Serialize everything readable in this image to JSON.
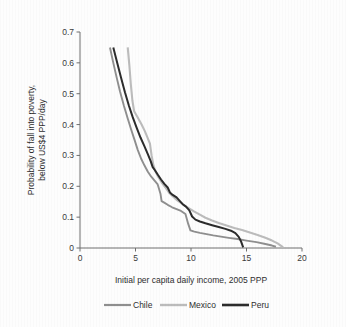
{
  "chart_data": {
    "type": "line",
    "title": "",
    "xlabel": "Initial per capita daily income, 2005 PPP",
    "ylabel": "Probability of fall into poverty, below US$4 PPP/day",
    "xlim": [
      0,
      20
    ],
    "ylim": [
      0,
      0.7
    ],
    "grid": false,
    "legend_position": "bottom",
    "xticks": [
      "0",
      "5",
      "10",
      "15",
      "20"
    ],
    "xtick_values": [
      0,
      5,
      10,
      15,
      20
    ],
    "yticks": [
      "0",
      "0.1",
      "0.2",
      "0.3",
      "0.4",
      "0.5",
      "0.6",
      "0.7"
    ],
    "ytick_values": [
      0,
      0.1,
      0.2,
      0.3,
      0.4,
      0.5,
      0.6,
      0.7
    ],
    "series": [
      {
        "name": "Chile",
        "color": "#8f8f8f",
        "width": 1.9,
        "points": [
          [
            2.7,
            0.65
          ],
          [
            3.0,
            0.6
          ],
          [
            3.3,
            0.553
          ],
          [
            3.6,
            0.508
          ],
          [
            3.95,
            0.462
          ],
          [
            4.3,
            0.42
          ],
          [
            4.6,
            0.385
          ],
          [
            4.9,
            0.352
          ],
          [
            5.2,
            0.318
          ],
          [
            5.5,
            0.29
          ],
          [
            5.8,
            0.268
          ],
          [
            6.1,
            0.248
          ],
          [
            6.4,
            0.232
          ],
          [
            6.7,
            0.219
          ],
          [
            7.0,
            0.206
          ],
          [
            7.25,
            0.176
          ],
          [
            7.35,
            0.152
          ],
          [
            7.55,
            0.148
          ],
          [
            7.9,
            0.14
          ],
          [
            8.3,
            0.132
          ],
          [
            8.7,
            0.126
          ],
          [
            9.1,
            0.12
          ],
          [
            9.5,
            0.11
          ],
          [
            9.75,
            0.078
          ],
          [
            9.95,
            0.057
          ],
          [
            10.3,
            0.053
          ],
          [
            10.8,
            0.049
          ],
          [
            11.4,
            0.045
          ],
          [
            12.0,
            0.041
          ],
          [
            12.7,
            0.037
          ],
          [
            13.4,
            0.033
          ],
          [
            14.2,
            0.029
          ],
          [
            15.0,
            0.024
          ],
          [
            15.9,
            0.019
          ],
          [
            16.7,
            0.013
          ],
          [
            17.3,
            0.008
          ],
          [
            17.65,
            0.004
          ]
        ]
      },
      {
        "name": "Mexico",
        "color": "#bcbcbc",
        "width": 2.1,
        "points": [
          [
            4.3,
            0.65
          ],
          [
            4.45,
            0.59
          ],
          [
            4.58,
            0.53
          ],
          [
            4.72,
            0.478
          ],
          [
            4.88,
            0.443
          ],
          [
            5.2,
            0.423
          ],
          [
            5.55,
            0.4
          ],
          [
            5.85,
            0.378
          ],
          [
            6.1,
            0.356
          ],
          [
            6.3,
            0.338
          ],
          [
            6.45,
            0.3
          ],
          [
            6.6,
            0.27
          ],
          [
            6.8,
            0.248
          ],
          [
            7.05,
            0.23
          ],
          [
            7.35,
            0.213
          ],
          [
            7.7,
            0.196
          ],
          [
            8.05,
            0.178
          ],
          [
            8.35,
            0.168
          ],
          [
            8.7,
            0.156
          ],
          [
            9.1,
            0.146
          ],
          [
            9.5,
            0.136
          ],
          [
            9.9,
            0.127
          ],
          [
            10.3,
            0.118
          ],
          [
            10.8,
            0.108
          ],
          [
            11.3,
            0.098
          ],
          [
            11.9,
            0.089
          ],
          [
            12.5,
            0.081
          ],
          [
            13.2,
            0.073
          ],
          [
            13.9,
            0.065
          ],
          [
            14.6,
            0.058
          ],
          [
            15.3,
            0.05
          ],
          [
            16.0,
            0.042
          ],
          [
            16.7,
            0.033
          ],
          [
            17.3,
            0.024
          ],
          [
            17.8,
            0.015
          ],
          [
            18.15,
            0.006
          ],
          [
            18.3,
            0.002
          ]
        ]
      },
      {
        "name": "Peru",
        "color": "#2c2c2c",
        "width": 2.0,
        "points": [
          [
            3.0,
            0.65
          ],
          [
            3.35,
            0.6
          ],
          [
            3.7,
            0.552
          ],
          [
            4.05,
            0.505
          ],
          [
            4.4,
            0.462
          ],
          [
            4.75,
            0.424
          ],
          [
            5.1,
            0.39
          ],
          [
            5.45,
            0.358
          ],
          [
            5.8,
            0.33
          ],
          [
            6.1,
            0.305
          ],
          [
            6.35,
            0.283
          ],
          [
            6.55,
            0.262
          ],
          [
            6.75,
            0.252
          ],
          [
            7.0,
            0.238
          ],
          [
            7.3,
            0.222
          ],
          [
            7.6,
            0.208
          ],
          [
            7.9,
            0.196
          ],
          [
            8.1,
            0.18
          ],
          [
            8.35,
            0.172
          ],
          [
            8.7,
            0.164
          ],
          [
            9.0,
            0.152
          ],
          [
            9.25,
            0.142
          ],
          [
            9.55,
            0.134
          ],
          [
            9.85,
            0.122
          ],
          [
            10.1,
            0.102
          ],
          [
            10.4,
            0.092
          ],
          [
            10.8,
            0.086
          ],
          [
            11.3,
            0.08
          ],
          [
            11.9,
            0.074
          ],
          [
            12.5,
            0.068
          ],
          [
            13.1,
            0.062
          ],
          [
            13.6,
            0.056
          ],
          [
            14.0,
            0.048
          ],
          [
            14.3,
            0.036
          ],
          [
            14.5,
            0.022
          ],
          [
            14.62,
            0.01
          ],
          [
            14.7,
            0.002
          ]
        ]
      }
    ]
  },
  "legend": {
    "items": [
      {
        "label": "Chile",
        "color": "#8f8f8f"
      },
      {
        "label": "Mexico",
        "color": "#bcbcbc"
      },
      {
        "label": "Peru",
        "color": "#2c2c2c"
      }
    ]
  },
  "axes": {
    "x_title": "Initial per capita daily income, 2005 PPP",
    "y_title_line1": "Probability of fall into poverty,",
    "y_title_line2": "below US$4 PPP/day"
  }
}
